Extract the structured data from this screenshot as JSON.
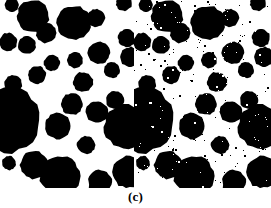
{
  "figure": {
    "caption": "(c)",
    "panel_count": 2,
    "background_color": "#ffffff",
    "foreground_color": "#000000"
  },
  "panels": [
    {
      "id": "clean-binary-image",
      "label": "left panel",
      "description": "clean binary blob image",
      "width": 134,
      "height": 188,
      "noise": false,
      "noise_density": 0
    },
    {
      "id": "noisy-binary-image",
      "label": "right panel",
      "description": "binary blob image corrupted with salt-and-pepper noise",
      "width": 137,
      "height": 188,
      "noise": true,
      "noise_density": 0.012
    }
  ],
  "blobs": [
    {
      "cx": 8,
      "cy": 42,
      "r": 9
    },
    {
      "cx": 12,
      "cy": 5,
      "r": 7
    },
    {
      "cx": 33,
      "cy": 16,
      "r": 16
    },
    {
      "cx": 27,
      "cy": 45,
      "r": 9
    },
    {
      "cx": 46,
      "cy": 33,
      "r": 10
    },
    {
      "cx": 52,
      "cy": 63,
      "r": 8
    },
    {
      "cx": 37,
      "cy": 75,
      "r": 9
    },
    {
      "cx": 13,
      "cy": 84,
      "r": 9
    },
    {
      "cx": 74,
      "cy": 23,
      "r": 17
    },
    {
      "cx": 75,
      "cy": 60,
      "r": 8
    },
    {
      "cx": 96,
      "cy": 18,
      "r": 9
    },
    {
      "cx": 99,
      "cy": 53,
      "r": 11
    },
    {
      "cx": 83,
      "cy": 82,
      "r": 10
    },
    {
      "cx": 112,
      "cy": 70,
      "r": 8
    },
    {
      "cx": 124,
      "cy": 3,
      "r": 8
    },
    {
      "cx": 127,
      "cy": 38,
      "r": 9
    },
    {
      "cx": 130,
      "cy": 57,
      "r": 10
    },
    {
      "cx": 115,
      "cy": 100,
      "r": 9
    },
    {
      "cx": 97,
      "cy": 112,
      "r": 11
    },
    {
      "cx": 72,
      "cy": 104,
      "r": 11
    },
    {
      "cx": 58,
      "cy": 126,
      "r": 13
    },
    {
      "cx": 8,
      "cy": 120,
      "r": 33
    },
    {
      "cx": 126,
      "cy": 127,
      "r": 22
    },
    {
      "cx": 60,
      "cy": 176,
      "r": 20
    },
    {
      "cx": 100,
      "cy": 182,
      "r": 12
    },
    {
      "cx": 34,
      "cy": 165,
      "r": 14
    },
    {
      "cx": 128,
      "cy": 172,
      "r": 16
    },
    {
      "cx": 9,
      "cy": 163,
      "r": 7
    },
    {
      "cx": 86,
      "cy": 145,
      "r": 9
    }
  ],
  "noise_specks": [
    {
      "x": 18,
      "y": 22,
      "s": 2,
      "on": false
    },
    {
      "x": 52,
      "y": 10,
      "s": 2,
      "on": false
    },
    {
      "x": 63,
      "y": 47,
      "s": 1,
      "on": true
    },
    {
      "x": 30,
      "y": 60,
      "s": 2,
      "on": true
    },
    {
      "x": 88,
      "y": 35,
      "s": 1,
      "on": true
    },
    {
      "x": 105,
      "y": 40,
      "s": 2,
      "on": true
    },
    {
      "x": 45,
      "y": 95,
      "s": 2,
      "on": true
    },
    {
      "x": 70,
      "y": 140,
      "s": 1,
      "on": true
    },
    {
      "x": 110,
      "y": 155,
      "s": 2,
      "on": true
    },
    {
      "x": 20,
      "y": 150,
      "s": 1,
      "on": true
    }
  ]
}
